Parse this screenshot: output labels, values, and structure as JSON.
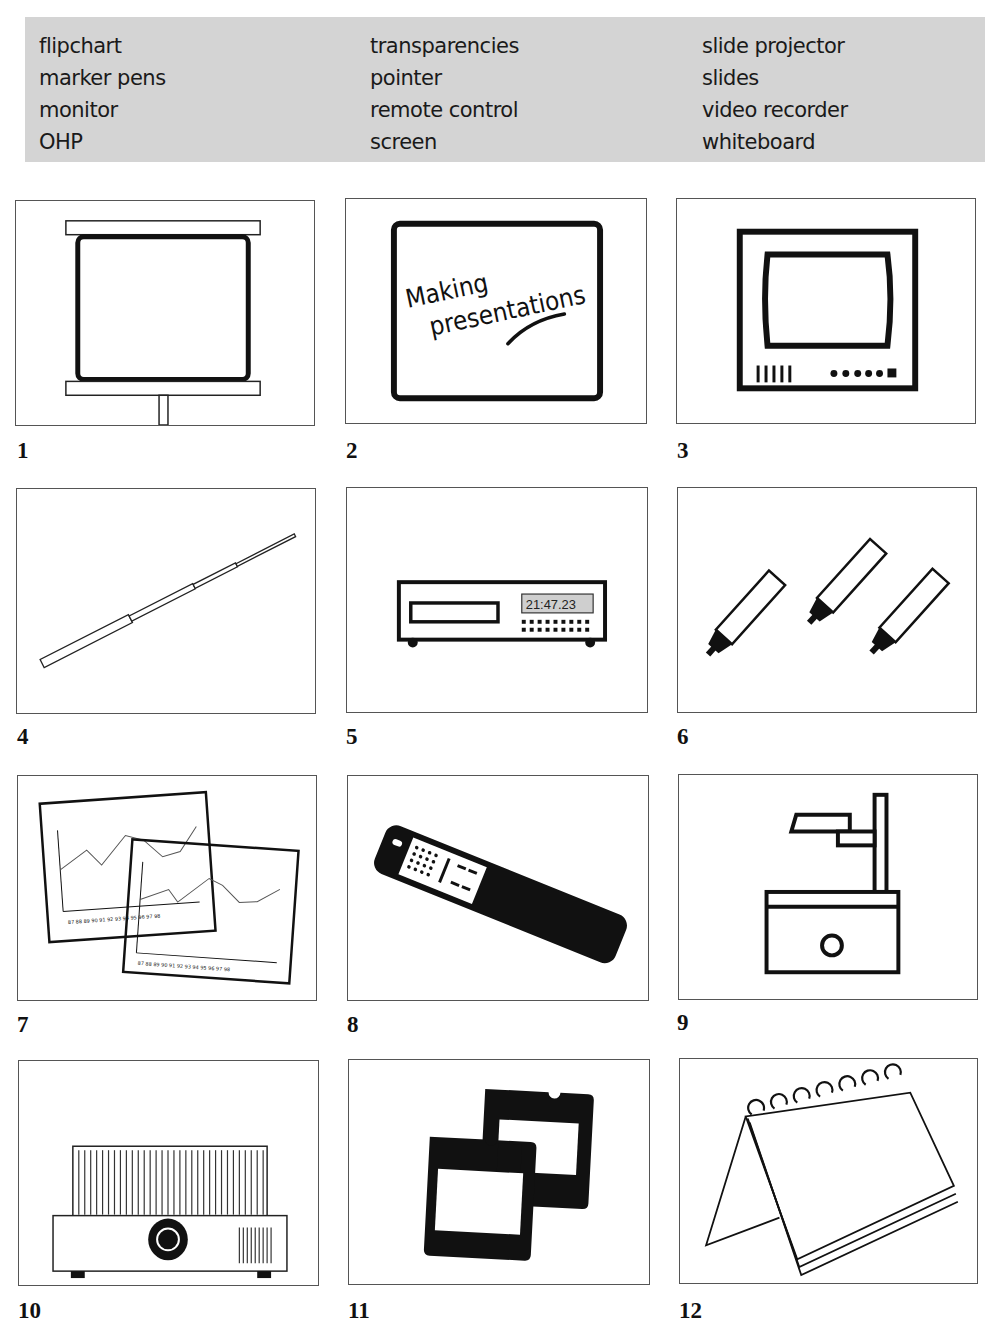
{
  "word_box": {
    "columns": [
      [
        "flipchart",
        "marker pens",
        "monitor",
        "OHP"
      ],
      [
        "transparencies",
        "pointer",
        "remote control",
        "screen"
      ],
      [
        "slide projector",
        "slides",
        "video recorder",
        "whiteboard"
      ]
    ]
  },
  "pictures": [
    {
      "number": "1",
      "icon": "projection-screen-icon"
    },
    {
      "number": "2",
      "icon": "whiteboard-icon",
      "text_line1": "Making",
      "text_line2": "presentations"
    },
    {
      "number": "3",
      "icon": "monitor-icon"
    },
    {
      "number": "4",
      "icon": "pointer-icon"
    },
    {
      "number": "5",
      "icon": "video-recorder-icon",
      "display": "21:47.23"
    },
    {
      "number": "6",
      "icon": "marker-pens-icon"
    },
    {
      "number": "7",
      "icon": "transparencies-icon",
      "y_ticks": [
        "11",
        "10",
        "9",
        "8",
        "7",
        "6",
        "5",
        "4",
        "3",
        "2",
        "1"
      ],
      "x_ticks": [
        "87",
        "88",
        "89",
        "90",
        "91",
        "92",
        "93",
        "94",
        "95",
        "96",
        "97",
        "98"
      ]
    },
    {
      "number": "8",
      "icon": "remote-control-icon"
    },
    {
      "number": "9",
      "icon": "ohp-icon"
    },
    {
      "number": "10",
      "icon": "slide-projector-icon"
    },
    {
      "number": "11",
      "icon": "slides-icon"
    },
    {
      "number": "12",
      "icon": "flipchart-icon"
    }
  ]
}
